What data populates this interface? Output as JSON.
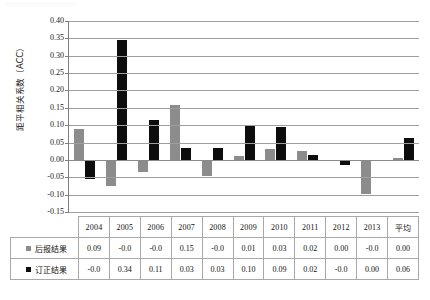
{
  "axis": {
    "y_title": "距平相关系数（ACC）",
    "y_ticks": [
      "0.40",
      "0.35",
      "0.30",
      "0.25",
      "0.20",
      "0.15",
      "0.10",
      "0.05",
      "0.00",
      "-0.05",
      "-0.10",
      "-0.15"
    ]
  },
  "legend": {
    "series0_label": "后报结果",
    "series1_label": "订正结果",
    "series0_color": "#8c8c8c",
    "series1_color": "#0d0d0d"
  },
  "table": {
    "headers": [
      "2004",
      "2005",
      "2006",
      "2007",
      "2008",
      "2009",
      "2010",
      "2011",
      "2012",
      "2013",
      "平均"
    ],
    "rows": [
      {
        "label": "后报结果",
        "values": [
          "0.09",
          "-0.0",
          "-0.0",
          "0.15",
          "-0.0",
          "0.01",
          "0.03",
          "0.02",
          "0.00",
          "-0.0",
          "0.00"
        ]
      },
      {
        "label": "订正结果",
        "values": [
          "-0.0",
          "0.34",
          "0.11",
          "0.03",
          "0.03",
          "0.10",
          "0.09",
          "0.02",
          "-0.0",
          "0.00",
          "0.06"
        ]
      }
    ]
  },
  "chart_data": {
    "type": "bar",
    "title": "",
    "xlabel": "",
    "ylabel": "距平相关系数（ACC）",
    "ylim": [
      -0.15,
      0.4
    ],
    "ytick_step": 0.05,
    "grid": true,
    "legend_position": "table-below",
    "categories": [
      "2004",
      "2005",
      "2006",
      "2007",
      "2008",
      "2009",
      "2010",
      "2011",
      "2012",
      "2013",
      "平均"
    ],
    "series": [
      {
        "name": "后报结果",
        "color": "#8c8c8c",
        "values": [
          0.09,
          -0.075,
          -0.035,
          0.157,
          -0.045,
          0.01,
          0.032,
          0.025,
          -0.002,
          -0.098,
          0.005
        ],
        "table_labels": [
          "0.09",
          "-0.0",
          "-0.0",
          "0.15",
          "-0.0",
          "0.01",
          "0.03",
          "0.02",
          "0.00",
          "-0.0",
          "0.00"
        ]
      },
      {
        "name": "订正结果",
        "color": "#0d0d0d",
        "values": [
          -0.055,
          0.345,
          0.115,
          0.035,
          0.035,
          0.098,
          0.095,
          0.015,
          -0.015,
          0.0,
          0.062
        ],
        "table_labels": [
          "-0.0",
          "0.34",
          "0.11",
          "0.03",
          "0.03",
          "0.10",
          "0.09",
          "0.02",
          "-0.0",
          "0.00",
          "0.06"
        ]
      }
    ]
  }
}
